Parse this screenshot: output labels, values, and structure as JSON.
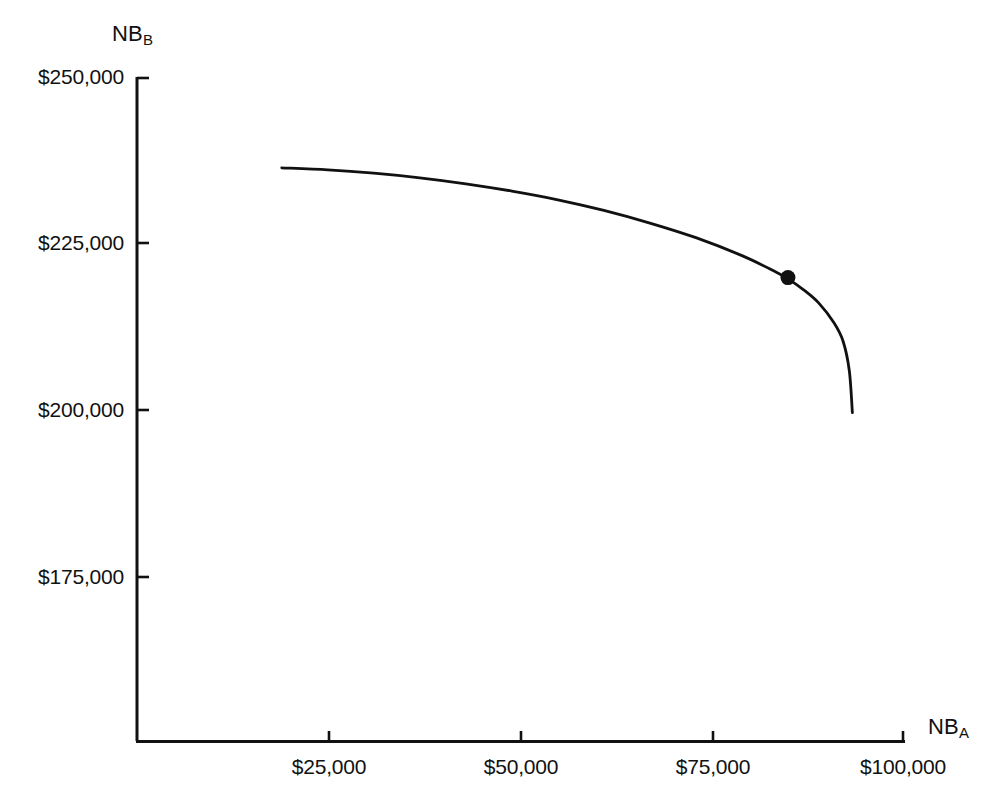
{
  "figure": {
    "width": 994,
    "height": 803,
    "background_color": "#ffffff",
    "ink_color": "#111111"
  },
  "chart_data": {
    "type": "line",
    "title": "",
    "subtitle": "",
    "xlabel_base": "NB",
    "xlabel_sub": "A",
    "ylabel_base": "NB",
    "ylabel_sub": "B",
    "xlabel_full": "NB_A",
    "ylabel_full": "NB_B",
    "grid": false,
    "legend": "none",
    "xlim": [
      0,
      100000
    ],
    "ylim": [
      150000,
      250000
    ],
    "x_ticks": [
      25000,
      50000,
      75000,
      100000
    ],
    "x_tick_labels": [
      "$25,000",
      "$50,000",
      "$75,000",
      "$100,000"
    ],
    "y_ticks": [
      175000,
      200000,
      225000,
      250000
    ],
    "y_tick_labels": [
      "$175,000",
      "$200,000",
      "$225,000",
      "$250,000"
    ],
    "series": [
      {
        "name": "utility-possibility-frontier",
        "style": "solid",
        "color": "#111111",
        "x": [
          19000,
          25000,
          31000,
          37000,
          43000,
          49000,
          55000,
          61000,
          67000,
          73000,
          79000,
          83000,
          85000,
          87000,
          89000,
          91000,
          92200,
          93000,
          93400
        ],
        "y": [
          236500,
          236200,
          235700,
          235000,
          234100,
          233000,
          231700,
          230100,
          228200,
          226000,
          223300,
          221100,
          219800,
          218200,
          216200,
          213200,
          210400,
          206000,
          199700
        ]
      }
    ],
    "annotated_points": [
      {
        "name": "bargaining-solution-point",
        "x": 85000,
        "y": 220000,
        "marker": "filled-circle",
        "color": "#111111",
        "label": ""
      }
    ]
  },
  "axes": {
    "y_axis_name": "y-axis-line",
    "x_axis_name": "x-axis-line"
  }
}
